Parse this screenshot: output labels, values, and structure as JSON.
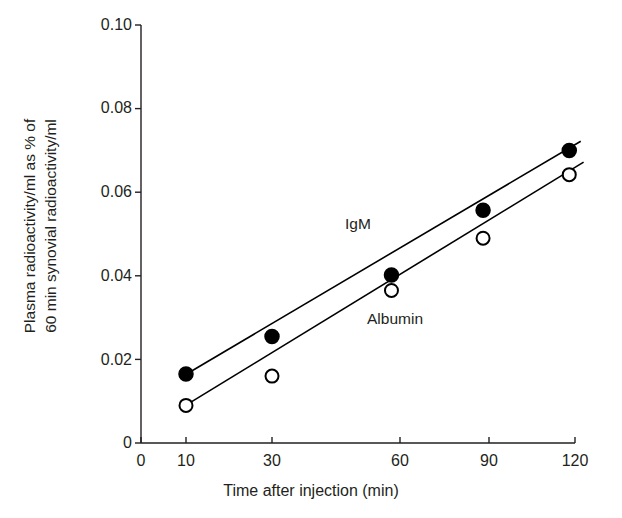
{
  "chart_data": {
    "type": "scatter",
    "title": "",
    "xlabel": "Time after injection (min)",
    "ylabel_line1": "Plasma radioactivity/ml as % of",
    "ylabel_line2": "60 min synovial radioactivity/ml",
    "xticks": [
      "0",
      "10",
      "30",
      "60",
      "90",
      "120"
    ],
    "xtick_values": [
      0,
      10,
      30,
      60,
      90,
      120
    ],
    "xtick_px": [
      141,
      186,
      272,
      400,
      489,
      575
    ],
    "yticks": [
      "0",
      "0.02",
      "0.04",
      "0.06",
      "0.08",
      "0.10"
    ],
    "ytick_values": [
      0,
      0.02,
      0.04,
      0.06,
      0.08,
      0.1
    ],
    "ylim": [
      0,
      0.1
    ],
    "grid": false,
    "legend_position": "inline-annotation",
    "series": [
      {
        "name": "IgM",
        "marker": "filled-circle",
        "color": "#000000",
        "x": [
          10,
          30,
          58,
          88,
          118
        ],
        "y": [
          0.0165,
          0.0255,
          0.0402,
          0.0557,
          0.07
        ],
        "trendline": {
          "x_start": 9,
          "y_start": 0.0158,
          "x_end": 122,
          "y_end": 0.0722
        }
      },
      {
        "name": "Albumin",
        "marker": "open-circle",
        "color": "#000000",
        "x": [
          10,
          30,
          58,
          88,
          118
        ],
        "y": [
          0.009,
          0.016,
          0.0365,
          0.049,
          0.0642
        ],
        "trendline": {
          "x_start": 9,
          "y_start": 0.0084,
          "x_end": 123,
          "y_end": 0.0672
        }
      }
    ],
    "annotations": [
      {
        "text": "IgM",
        "x_px": 345,
        "y_px": 215
      },
      {
        "text": "Albumin",
        "x_px": 367,
        "y_px": 310
      }
    ]
  },
  "axes": {
    "line_color": "#231f20",
    "axis_line_width": 1.4,
    "tick_length": 6
  }
}
